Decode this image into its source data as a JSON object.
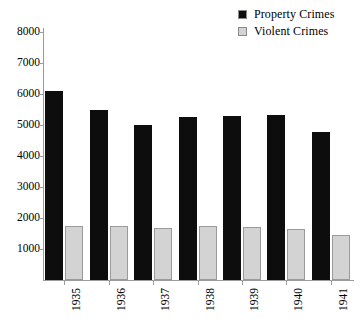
{
  "chart_data": {
    "type": "bar",
    "title": "",
    "subtitle": "",
    "xlabel": "",
    "ylabel": "",
    "categories": [
      "1935",
      "1936",
      "1937",
      "1938",
      "1939",
      "1940",
      "1941"
    ],
    "series": [
      {
        "name": "Property Crimes",
        "color": "#0d0d0d",
        "values": [
          6100,
          5500,
          5000,
          5250,
          5300,
          5320,
          4780
        ]
      },
      {
        "name": "Violent Crimes",
        "color": "#d3d3d3",
        "values": [
          1750,
          1730,
          1680,
          1730,
          1700,
          1660,
          1450
        ]
      }
    ],
    "ylim": [
      0,
      8000
    ],
    "yticks": [
      1000,
      2000,
      3000,
      4000,
      5000,
      6000,
      7000,
      8000
    ],
    "ytick_labels": [
      "1000",
      "2000",
      "3000",
      "4000",
      "5000",
      "6000",
      "7000",
      "8000"
    ],
    "grid": false,
    "legend_position": "top-right",
    "xtick_rotation": 90
  },
  "legend": {
    "entries": [
      {
        "label": "Property Crimes",
        "swatch_color": "#0d0d0d"
      },
      {
        "label": "Violent Crimes",
        "swatch_color": "#d3d3d3"
      }
    ]
  },
  "axes": {
    "axis_color": "#9b9b9b"
  }
}
